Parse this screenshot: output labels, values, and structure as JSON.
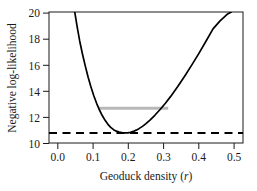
{
  "chart_data": {
    "type": "line",
    "title": "",
    "subtitle": "",
    "xlabel_text": "Geoduck density (",
    "xlabel_italic": "r",
    "xlabel_tail": ")",
    "xlabel": "Geoduck density (r)",
    "ylabel": "Negative log-likelihood",
    "xlim": [
      -0.025,
      0.525
    ],
    "ylim": [
      9.9,
      20.3
    ],
    "xticks": [
      0.0,
      0.1,
      0.2,
      0.3,
      0.4,
      0.5
    ],
    "xtick_labels": [
      "0.0",
      "0.1",
      "0.2",
      "0.3",
      "0.4",
      "0.5"
    ],
    "yticks": [
      10,
      12,
      14,
      16,
      18,
      20
    ],
    "ytick_labels": [
      "10",
      "12",
      "14",
      "16",
      "18",
      "20"
    ],
    "grid": false,
    "legend_position": "none",
    "series": [
      {
        "name": "profile-negative-log-likelihood",
        "style": "solid",
        "color": "#000000",
        "linewidth": 1.7,
        "x": [
          0.048,
          0.055,
          0.062,
          0.07,
          0.078,
          0.086,
          0.094,
          0.102,
          0.11,
          0.118,
          0.126,
          0.134,
          0.142,
          0.15,
          0.158,
          0.166,
          0.174,
          0.182,
          0.19,
          0.198,
          0.206,
          0.214,
          0.222,
          0.23,
          0.24,
          0.25,
          0.262,
          0.275,
          0.29,
          0.305,
          0.32,
          0.34,
          0.36,
          0.38,
          0.4,
          0.42,
          0.44,
          0.46,
          0.48,
          0.492
        ],
        "y": [
          20.3,
          19.1,
          18.0,
          16.95,
          16.0,
          15.12,
          14.35,
          13.65,
          13.05,
          12.52,
          12.08,
          11.7,
          11.38,
          11.14,
          10.96,
          10.84,
          10.76,
          10.72,
          10.7,
          10.71,
          10.75,
          10.82,
          10.92,
          11.04,
          11.22,
          11.44,
          11.74,
          12.1,
          12.56,
          13.06,
          13.6,
          14.38,
          15.22,
          16.1,
          17.02,
          17.98,
          18.96,
          19.6,
          20.12,
          20.3
        ]
      }
    ],
    "annotations": [
      {
        "name": "confidence-interval-line",
        "type": "hline-segment",
        "style": "solid",
        "color": "#b8b8b8",
        "linewidth": 3.0,
        "y": 12.65,
        "x_start": 0.115,
        "x_end": 0.313,
        "description": "grey horizontal line marking 95% confidence interval bounds"
      },
      {
        "name": "minimum-level-line",
        "type": "hline",
        "style": "dashed",
        "color": "#000000",
        "linewidth": 2.0,
        "y": 10.7,
        "x_start": -0.025,
        "x_end": 0.525,
        "description": "dashed horizontal line at the minimum negative log-likelihood"
      }
    ],
    "minimum": {
      "x": 0.195,
      "y": 10.7
    }
  }
}
